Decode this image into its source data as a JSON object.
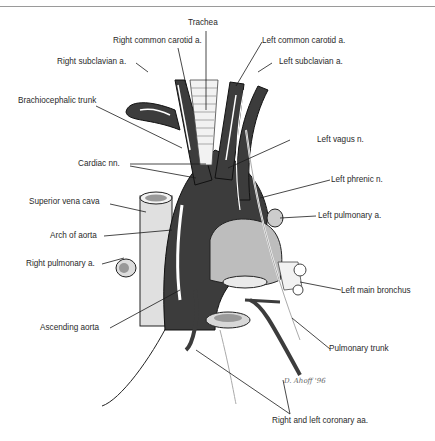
{
  "header": {
    "running_head": ""
  },
  "diagram": {
    "labels": {
      "trachea": "Trachea",
      "right_common_carotid": "Right common carotid a.",
      "left_common_carotid": "Left common carotid a.",
      "right_subclavian": "Right subclavian a.",
      "left_subclavian": "Left subclavian a.",
      "brachiocephalic_trunk": "Brachiocephalic trunk",
      "left_vagus": "Left vagus n.",
      "cardiac_nn": "Cardiac nn.",
      "left_phrenic": "Left phrenic n.",
      "superior_vena_cava": "Superior vena cava",
      "left_pulmonary_a": "Left pulmonary a.",
      "arch_of_aorta": "Arch of aorta",
      "right_pulmonary_a": "Right pulmonary a.",
      "left_main_bronchus": "Left main bronchus",
      "ascending_aorta": "Ascending aorta",
      "pulmonary_trunk": "Pulmonary trunk",
      "coronary_aa": "Right and left coronary aa."
    },
    "signature": "D. Ahoff '96",
    "colors": {
      "vessel": "#3c3c3c",
      "vessel_dark": "#2a2a2a",
      "light": "#cfcfcf",
      "line": "#1a1a1a"
    }
  }
}
